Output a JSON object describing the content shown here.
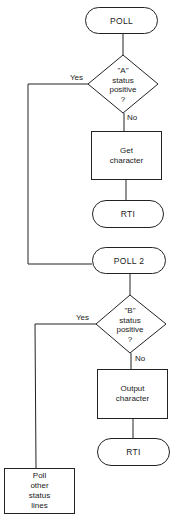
{
  "flowchart": {
    "nodes": {
      "poll": {
        "type": "terminal",
        "label": "POLL"
      },
      "decision_a": {
        "type": "decision",
        "lines": [
          "\"A\"",
          "status",
          "positive",
          "?"
        ]
      },
      "get_character": {
        "type": "process",
        "lines": [
          "Get",
          "character"
        ]
      },
      "rti_1": {
        "type": "terminal",
        "label": "RTI"
      },
      "poll_2": {
        "type": "terminal",
        "label": "POLL 2"
      },
      "decision_b": {
        "type": "decision",
        "lines": [
          "\"B\"",
          "status",
          "positive",
          "?"
        ]
      },
      "output_character": {
        "type": "process",
        "lines": [
          "Output",
          "character"
        ]
      },
      "rti_2": {
        "type": "terminal",
        "label": "RTI"
      },
      "poll_other": {
        "type": "process",
        "lines": [
          "Poll",
          "other",
          "status",
          "lines"
        ]
      }
    },
    "edge_labels": {
      "a_yes": "Yes",
      "a_no": "No",
      "b_yes": "Yes",
      "b_no": "No"
    },
    "edges": [
      {
        "from": "poll",
        "to": "decision_a"
      },
      {
        "from": "decision_a",
        "to": "get_character",
        "label": "No"
      },
      {
        "from": "get_character",
        "to": "rti_1"
      },
      {
        "from": "decision_a",
        "to": "poll_2",
        "label": "Yes"
      },
      {
        "from": "poll_2",
        "to": "decision_b"
      },
      {
        "from": "decision_b",
        "to": "output_character",
        "label": "No"
      },
      {
        "from": "output_character",
        "to": "rti_2"
      },
      {
        "from": "decision_b",
        "to": "poll_other",
        "label": "Yes"
      }
    ],
    "colors": {
      "line": "#222222",
      "background": "#ffffff"
    }
  }
}
